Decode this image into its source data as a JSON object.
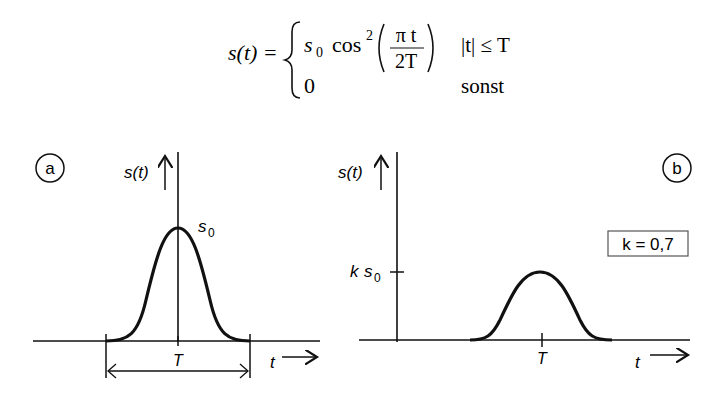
{
  "formula": {
    "lhs": "s(t) =",
    "case1_expr_prefix": "s",
    "case1_expr_sub": "0",
    "case1_cos": "cos",
    "case1_exp": "2",
    "case1_num": "π t",
    "case1_den": "2T",
    "case1_cond": "|t| ≤ T",
    "case2_expr": "0",
    "case2_cond": "sonst"
  },
  "panel_a": {
    "badge": "a",
    "y_label": "s(t)",
    "peak_label_main": "s",
    "peak_label_sub": "0",
    "width_label": "T",
    "x_label": "t"
  },
  "panel_b": {
    "badge": "b",
    "y_label": "s(t)",
    "level_label_k": "k",
    "level_label_s": "s",
    "level_label_sub": "0",
    "tick_label": "T",
    "x_label": "t",
    "param_box": "k = 0,7"
  },
  "colors": {
    "ink": "#111111",
    "background": "#ffffff",
    "box_border": "#555555"
  }
}
